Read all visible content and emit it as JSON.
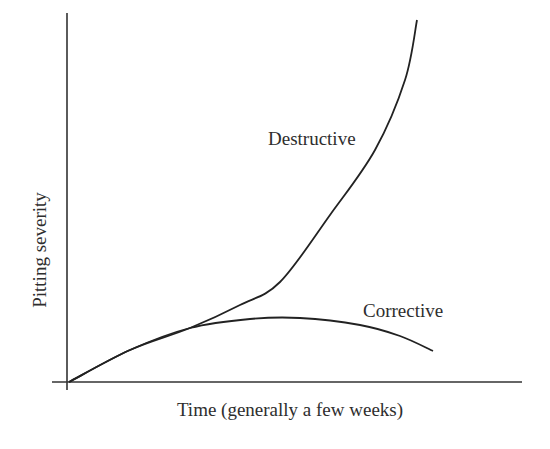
{
  "chart_data": {
    "type": "line",
    "title": "",
    "xlabel": "Time (generally a few weeks)",
    "ylabel": "Pitting severity",
    "grid": false,
    "legend": "inline labels",
    "axis_ticks": "none",
    "series": [
      {
        "name": "Destructive",
        "description": "Follows common initial rise, then accelerates upward steeply",
        "points_px": [
          [
            69,
            382
          ],
          [
            130,
            350
          ],
          [
            190,
            328
          ],
          [
            240,
            305
          ],
          [
            280,
            282
          ],
          [
            330,
            215
          ],
          [
            375,
            150
          ],
          [
            405,
            80
          ],
          [
            417,
            20
          ]
        ]
      },
      {
        "name": "Corrective",
        "description": "Follows common initial rise, levels off, then declines",
        "points_px": [
          [
            69,
            382
          ],
          [
            130,
            350
          ],
          [
            190,
            328
          ],
          [
            250,
            319
          ],
          [
            300,
            318
          ],
          [
            360,
            325
          ],
          [
            400,
            336
          ],
          [
            433,
            351
          ]
        ]
      }
    ],
    "annotations": [
      "Destructive",
      "Corrective"
    ],
    "colors": {
      "line": "#222222",
      "axis": "#333333",
      "background": "#ffffff"
    }
  },
  "labels": {
    "xlabel": "Time (generally a few weeks)",
    "ylabel": "Pitting severity",
    "destructive": "Destructive",
    "corrective": "Corrective"
  }
}
